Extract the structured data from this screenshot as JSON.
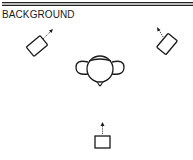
{
  "header": {
    "label": "BACKGROUND"
  },
  "diagram": {
    "elements": [
      {
        "name": "left-speaker",
        "direction": "up-right"
      },
      {
        "name": "right-speaker",
        "direction": "up-left"
      },
      {
        "name": "listener-head",
        "shape": "head with shoulders"
      },
      {
        "name": "rear-speaker",
        "direction": "up"
      }
    ],
    "stroke_color": "#1a1a1a"
  }
}
